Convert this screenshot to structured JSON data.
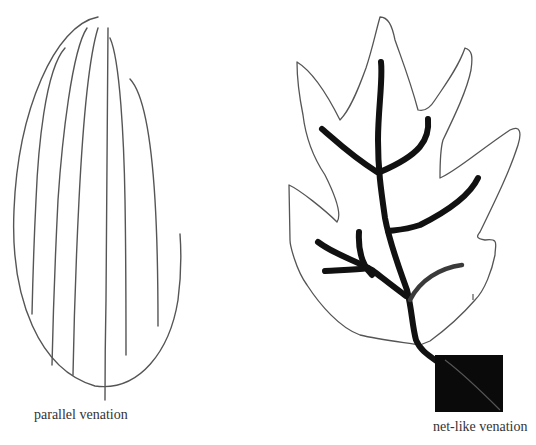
{
  "figure": {
    "left_panel": {
      "title": "parallel venation",
      "description": "elongated leaf with parallel veins"
    },
    "right_panel": {
      "title": "net-like venation",
      "description": "lobed leaf with branching midrib and veins, petiole in black square"
    }
  },
  "colors": {
    "outline": "#555555",
    "vein": "#111111",
    "vein_gray": "#3a3a3a",
    "background": "#ffffff"
  }
}
